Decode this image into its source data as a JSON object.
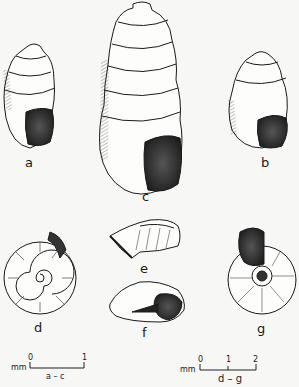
{
  "figure": {
    "specimens": [
      {
        "id": "a",
        "label": "a",
        "view": "apertural, tall conic shell"
      },
      {
        "id": "b",
        "label": "b",
        "view": "apertural, ovate shell"
      },
      {
        "id": "c",
        "label": "c",
        "view": "apertural, large elongate shell"
      },
      {
        "id": "d",
        "label": "d",
        "view": "apical view, planispiral shell"
      },
      {
        "id": "e",
        "label": "e",
        "view": "side view"
      },
      {
        "id": "f",
        "label": "f",
        "view": "apertural side view"
      },
      {
        "id": "g",
        "label": "g",
        "view": "umbilical view"
      }
    ],
    "scales": [
      {
        "unit": "mm",
        "ticks": [
          "0",
          "1"
        ],
        "caption": "a – c"
      },
      {
        "unit": "mm",
        "ticks": [
          "0",
          "1",
          "2"
        ],
        "caption": "d – g"
      }
    ]
  },
  "colors": {
    "ink": "#1a1a1a",
    "paper": "#f7f7f5",
    "aperture": "#2a2a2a"
  }
}
